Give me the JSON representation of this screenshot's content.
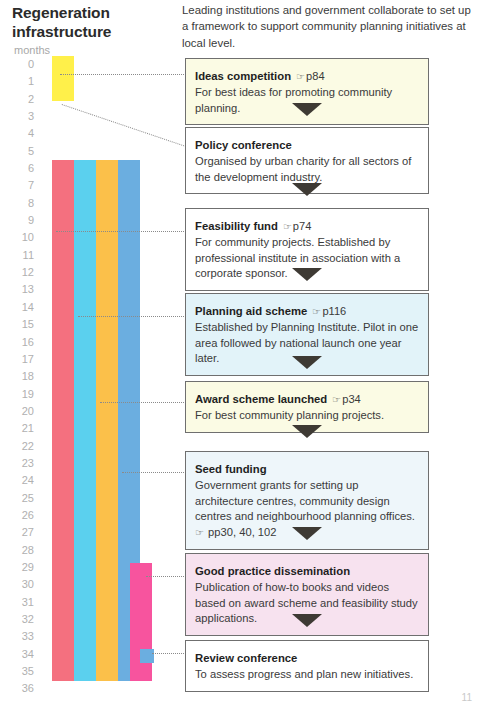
{
  "chart_title": "Regeneration\ninfrastructure",
  "title_line1": "Regeneration",
  "title_line2": "infrastructure",
  "axis": {
    "label": "months",
    "ticks": [
      "0",
      "1",
      "2",
      "3",
      "4",
      "5",
      "6",
      "7",
      "8",
      "9",
      "10",
      "11",
      "12",
      "13",
      "14",
      "15",
      "16",
      "17",
      "18",
      "19",
      "20",
      "21",
      "22",
      "23",
      "24",
      "25",
      "26",
      "27",
      "28",
      "29",
      "30",
      "31",
      "32",
      "33",
      "34",
      "35",
      "36"
    ],
    "min": 0,
    "max": 36
  },
  "intro": "Leading institutions and government collaborate to set up a framework to support community planning initiatives at local level.",
  "page_number": "11",
  "ref_icon": "pointing-hand-icon",
  "chart_data": {
    "type": "bar",
    "title": "Regeneration infrastructure",
    "xlabel": "",
    "ylabel": "months",
    "ylim": [
      0,
      36
    ],
    "orientation": "vertical-timeline",
    "categories": [
      "Ideas competition",
      "Feasibility fund",
      "Planning aid scheme",
      "Award scheme launched",
      "Seed funding",
      "Good practice dissemination",
      "Review conference"
    ],
    "bars": [
      {
        "name": "ideas-competition-bar",
        "color": "#FFF04A",
        "start_month": 0,
        "end_month": 2.6,
        "track": 0
      },
      {
        "name": "feasibility-fund-bar",
        "color": "#F4707F",
        "start_month": 6,
        "end_month": 36,
        "track": 0
      },
      {
        "name": "planning-aid-bar",
        "color": "#5BD0EE",
        "start_month": 6,
        "end_month": 36,
        "track": 1
      },
      {
        "name": "award-scheme-bar",
        "color": "#FBC04A",
        "start_month": 6,
        "end_month": 36,
        "track": 2
      },
      {
        "name": "seed-funding-bar",
        "color": "#6BAEE0",
        "start_month": 6,
        "end_month": 36,
        "track": 3
      },
      {
        "name": "good-practice-bar",
        "color": "#F7549E",
        "start_month": 29.2,
        "end_month": 36,
        "track": 4
      },
      {
        "name": "review-conference-bar",
        "color": "#6BAEE0",
        "start_month": 34.2,
        "end_month": 35,
        "track": 5
      }
    ]
  },
  "steps": [
    {
      "id": "ideas-competition",
      "title": "Ideas competition",
      "ref": "p84",
      "desc": "For best ideas for promoting community planning.",
      "bg": "#FBFBE4"
    },
    {
      "id": "policy-conference",
      "title": "Policy conference",
      "ref": "",
      "desc": "Organised by urban charity for all sectors of the development industry.",
      "bg": "#FFFFFF"
    },
    {
      "id": "feasibility-fund",
      "title": "Feasibility fund",
      "ref": "p74",
      "desc": "For community projects. Established by professional institute in association with a corporate sponsor.",
      "bg": "#FFFFFF"
    },
    {
      "id": "planning-aid-scheme",
      "title": "Planning aid scheme",
      "ref": "p116",
      "desc": "Established by Planning Institute. Pilot in one area followed by national launch one year later.",
      "bg": "#E2F3F9"
    },
    {
      "id": "award-scheme-launched",
      "title": "Award scheme launched",
      "ref": "p34",
      "desc": "For best community planning projects.",
      "bg": "#FBFBE4"
    },
    {
      "id": "seed-funding",
      "title": "Seed funding",
      "ref": "",
      "desc_part1": "Government grants for setting up architecture centres, community design centres and neighbourhood planning offices.",
      "desc_inline_ref": "pp30, 40, 102",
      "desc": "Government grants for setting up architecture centres, community design centres and neighbourhood planning offices.",
      "bg": "#EEF6FA"
    },
    {
      "id": "good-practice-dissemination",
      "title": "Good practice dissemination",
      "ref": "",
      "desc": "Publication of how-to books and videos based on award scheme and feasibility study applications.",
      "bg": "#F7E2EF"
    },
    {
      "id": "review-conference",
      "title": "Review conference",
      "ref": "",
      "desc": "To assess progress and plan new initiatives.",
      "bg": "#FFFFFF"
    }
  ]
}
